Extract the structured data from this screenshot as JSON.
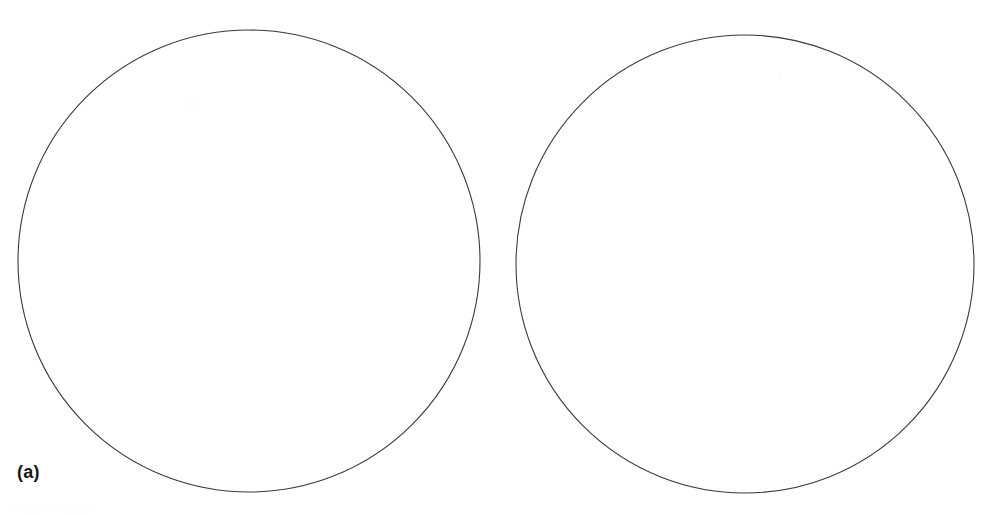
{
  "figure": {
    "width": 997,
    "height": 516,
    "background_color": "#ffffff",
    "stroke_color": "#3a3a3a",
    "label_color": "#161616",
    "caption_clipped_text": "Figure 4. (a) (b)"
  },
  "panels": [
    {
      "id": "a",
      "label": "(a)",
      "shape": "circle",
      "center_x": 249,
      "center_y": 261,
      "radius": 231
    },
    {
      "id": "b",
      "label": "(b)",
      "shape": "circle",
      "center_x": 745,
      "center_y": 264,
      "radius": 229
    }
  ],
  "chart_data": {
    "type": "scatter",
    "title": "",
    "subtitle": "",
    "xlabel": "",
    "ylabel": "",
    "grid": false,
    "legend": null,
    "annotations": [
      "(a)",
      "(b)"
    ],
    "panels": [
      {
        "name": "(a)",
        "shapes": [
          {
            "type": "circle",
            "cx": 249,
            "cy": 261,
            "r": 231,
            "fill": "none",
            "stroke": "#3a3a3a",
            "stroke_width": 1.1
          }
        ],
        "points": [
          {
            "x": 192,
            "y": 104,
            "color": "#fcfcfc",
            "r": 2.2
          }
        ]
      },
      {
        "name": "(b)",
        "shapes": [
          {
            "type": "circle",
            "cx": 745,
            "cy": 264,
            "r": 229,
            "fill": "none",
            "stroke": "#3a3a3a",
            "stroke_width": 1.1
          }
        ],
        "points": [
          {
            "x": 780,
            "y": 77,
            "color": "#fcfcfc",
            "r": 2.0
          }
        ]
      }
    ]
  }
}
